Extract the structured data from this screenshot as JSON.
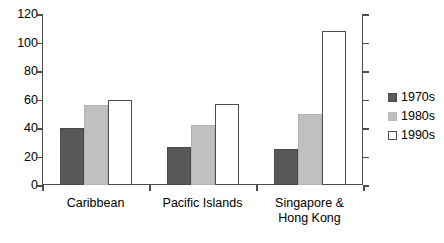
{
  "chart_data": {
    "type": "bar",
    "title": "",
    "subtitle": "",
    "xlabel": "",
    "ylabel": "",
    "ylim": [
      0,
      120
    ],
    "ytick_step": 20,
    "yticks": [
      0,
      20,
      40,
      60,
      80,
      100,
      120
    ],
    "ytick_labels": [
      "0",
      "20",
      "40",
      "60",
      "80",
      "100",
      "120"
    ],
    "grid": true,
    "grid_axis": "y",
    "legend_position": "right",
    "categories": [
      "Caribbean",
      "Pacific Islands",
      "Singapore & Hong Kong"
    ],
    "category_label_lines": [
      [
        "Caribbean"
      ],
      [
        "Pacific Islands"
      ],
      [
        "Singapore &",
        "Hong Kong"
      ]
    ],
    "series": [
      {
        "name": "1970s",
        "color": "#595959",
        "values": [
          40,
          27,
          25
        ]
      },
      {
        "name": "1980s",
        "color": "#c0c0c0",
        "values": [
          56,
          42,
          50
        ]
      },
      {
        "name": "1990s",
        "color": "#ffffff",
        "values": [
          60,
          57,
          108
        ]
      }
    ]
  },
  "legend": {
    "items": [
      {
        "label": "1970s",
        "swatch": "dark-gray-swatch"
      },
      {
        "label": "1980s",
        "swatch": "light-gray-swatch"
      },
      {
        "label": "1990s",
        "swatch": "white-swatch"
      }
    ]
  },
  "colors": {
    "series_1970s": "#595959",
    "series_1980s": "#c0c0c0",
    "series_1990s": "#ffffff",
    "axis": "#4d4d4d",
    "gridline": "#9a9a9a",
    "background": "#ffffff",
    "text": "#000000"
  }
}
